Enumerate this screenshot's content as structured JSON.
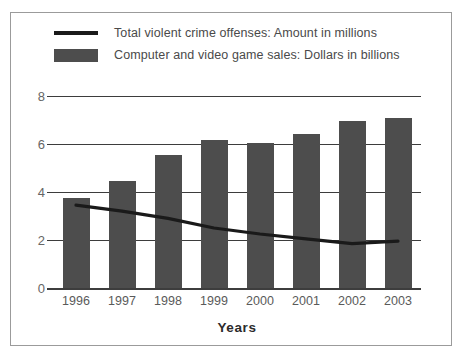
{
  "chart_data": {
    "type": "bar",
    "title": "",
    "subtitle": "",
    "xlabel": "Years",
    "ylabel": "",
    "categories": [
      "1996",
      "1997",
      "1998",
      "1999",
      "2000",
      "2001",
      "2002",
      "2003"
    ],
    "x": [
      1996,
      1997,
      1998,
      1999,
      2000,
      2001,
      2002,
      2003
    ],
    "ylim": [
      0,
      8
    ],
    "yticks": [
      0,
      2,
      4,
      6,
      8
    ],
    "ytick_labels": [
      "0",
      "2",
      "4",
      "6",
      "8"
    ],
    "grid": true,
    "legend_position": "top-left",
    "series": [
      {
        "name": "Computer and video game sales: Dollars in billions",
        "type": "bar",
        "color": "#4d4d4d",
        "values": [
          3.75,
          4.45,
          5.55,
          6.15,
          6.05,
          6.4,
          6.95,
          7.1
        ]
      },
      {
        "name": "Total violent crime offenses: Amount in millions",
        "type": "line",
        "color": "#1a1a1a",
        "values": [
          3.45,
          3.2,
          2.9,
          2.5,
          2.25,
          2.05,
          1.85,
          1.95
        ]
      }
    ]
  },
  "legend": {
    "items": [
      {
        "key": "line",
        "label": "Total violent crime offenses: Amount in millions"
      },
      {
        "key": "swatch",
        "label": "Computer and video game sales: Dollars in billions"
      }
    ]
  },
  "colors": {
    "bar": "#4d4d4d",
    "line": "#1a1a1a",
    "grid": "#3d3d3d",
    "frame": "#9b9b9b",
    "tick_text": "#666666",
    "legend_text": "#4a4a4a",
    "axis_title": "#2b2b2b",
    "background": "#ffffff"
  }
}
